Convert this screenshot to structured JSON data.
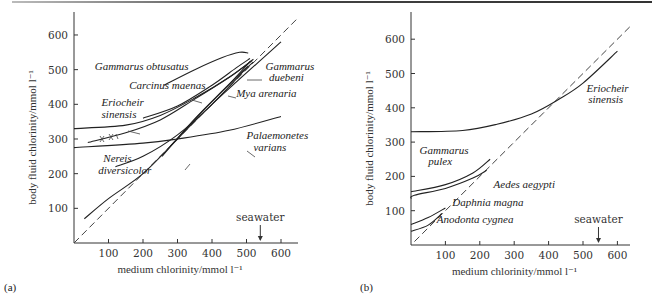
{
  "chart_data": [
    {
      "type": "line",
      "panel_label": "(a)",
      "title": "",
      "xlabel": "medium chlorinity/mmol l⁻¹",
      "ylabel": "body fluid chlorinity/mmol l⁻¹",
      "xlim": [
        0,
        650
      ],
      "ylim": [
        0,
        650
      ],
      "x_ticks": [
        100,
        200,
        300,
        400,
        500,
        600
      ],
      "y_ticks": [
        100,
        200,
        300,
        400,
        500,
        600
      ],
      "grid": false,
      "annotation": {
        "text": "seawater",
        "x": 540
      },
      "series": [
        {
          "name": "isosmotic line",
          "style": "dashed",
          "x": [
            0,
            650
          ],
          "y": [
            0,
            650
          ]
        },
        {
          "name": "Gammarus obtusatus",
          "x": [
            260,
            350,
            430,
            480,
            505
          ],
          "y": [
            455,
            500,
            535,
            550,
            548
          ]
        },
        {
          "name": "Carcinus maenas",
          "x": [
            200,
            300,
            400,
            470,
            510
          ],
          "y": [
            360,
            395,
            455,
            505,
            532
          ]
        },
        {
          "name": "Eriocheir sinensis",
          "x": [
            0,
            150,
            250,
            350,
            450,
            520
          ],
          "y": [
            330,
            340,
            368,
            418,
            478,
            530
          ]
        },
        {
          "name": "Eriocheir sinensis (lower)",
          "x": [
            40,
            150,
            250,
            350,
            450,
            515
          ],
          "y": [
            290,
            318,
            355,
            415,
            478,
            525
          ]
        },
        {
          "name": "Palaemonetes varians",
          "x": [
            0,
            200,
            300,
            450,
            600
          ],
          "y": [
            275,
            288,
            300,
            325,
            365
          ]
        },
        {
          "name": "Nereis diversicolor",
          "x": [
            120,
            200,
            300,
            400,
            505
          ],
          "y": [
            220,
            250,
            312,
            400,
            510
          ]
        },
        {
          "name": "Nereis diversicolor (dilute)",
          "x": [
            30,
            100,
            200,
            300,
            400,
            600
          ],
          "y": [
            70,
            128,
            200,
            300,
            400,
            580
          ]
        },
        {
          "name": "Mya arenaria",
          "x": [
            255,
            350,
            450,
            512
          ],
          "y": [
            250,
            358,
            458,
            525
          ]
        },
        {
          "name": "Gammarus duebeni",
          "x": [
            280,
            380,
            470,
            520
          ],
          "y": [
            280,
            388,
            478,
            522
          ]
        }
      ],
      "labels": [
        {
          "text": "Gammarus obtusatus",
          "x": 60,
          "y": 500
        },
        {
          "text": "Carcinus maenas",
          "x": 160,
          "y": 445
        },
        {
          "text": "Eriocheir",
          "x": 80,
          "y": 395
        },
        {
          "text": "sinensis",
          "x": 80,
          "y": 360
        },
        {
          "text": "Gammarus",
          "x": 555,
          "y": 500
        },
        {
          "text": "duebeni",
          "x": 565,
          "y": 468
        },
        {
          "text": "Mya arenaria",
          "x": 470,
          "y": 420
        },
        {
          "text": "Palaemonetes",
          "x": 500,
          "y": 300
        },
        {
          "text": "varians",
          "x": 520,
          "y": 265
        },
        {
          "text": "Nereis",
          "x": 85,
          "y": 235
        },
        {
          "text": "diversicolor",
          "x": 70,
          "y": 200
        }
      ]
    },
    {
      "type": "line",
      "panel_label": "(b)",
      "title": "",
      "xlabel": "medium chlorinity/mmol l⁻¹",
      "ylabel": "body fluid chlorinity/mmol l⁻¹",
      "xlim": [
        0,
        650
      ],
      "ylim": [
        0,
        650
      ],
      "x_ticks": [
        100,
        200,
        300,
        400,
        500,
        600
      ],
      "y_ticks": [
        100,
        200,
        300,
        400,
        500,
        600
      ],
      "grid": false,
      "annotation": {
        "text": "seawater",
        "x": 545
      },
      "series": [
        {
          "name": "isosmotic line",
          "style": "dashed",
          "x": [
            10,
            640
          ],
          "y": [
            10,
            640
          ]
        },
        {
          "name": "Eriocheir sinensis",
          "x": [
            0,
            150,
            250,
            350,
            430,
            500,
            600
          ],
          "y": [
            330,
            334,
            352,
            382,
            425,
            472,
            565
          ]
        },
        {
          "name": "Gammarus pulex",
          "x": [
            0,
            100,
            180,
            230
          ],
          "y": [
            155,
            176,
            210,
            250
          ]
        },
        {
          "name": "Aedes aegypti",
          "x": [
            0,
            10,
            100,
            180,
            220
          ],
          "y": [
            135,
            145,
            165,
            195,
            218
          ]
        },
        {
          "name": "Daphnia magna",
          "x": [
            0,
            50,
            100
          ],
          "y": [
            60,
            80,
            108
          ]
        },
        {
          "name": "Anodonta cygnea",
          "x": [
            0,
            50,
            90
          ],
          "y": [
            40,
            58,
            92
          ]
        }
      ],
      "labels": [
        {
          "text": "Eriocheir",
          "x": 510,
          "y": 445
        },
        {
          "text": "sinensis",
          "x": 515,
          "y": 415
        },
        {
          "text": "Gammarus",
          "x": 25,
          "y": 265
        },
        {
          "text": "pulex",
          "x": 50,
          "y": 232
        },
        {
          "text": "Aedes aegypti",
          "x": 240,
          "y": 165
        },
        {
          "text": "Daphnia magna",
          "x": 120,
          "y": 115
        },
        {
          "text": "Anodonta cygnea",
          "x": 75,
          "y": 65
        }
      ]
    }
  ]
}
